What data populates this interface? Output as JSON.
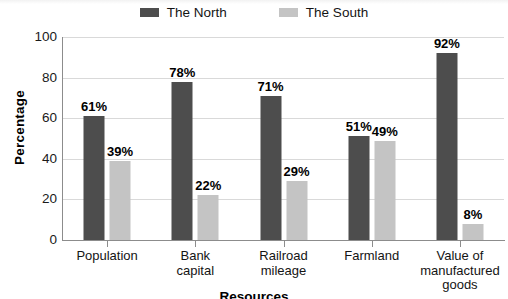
{
  "chart_data": {
    "type": "bar",
    "title": "",
    "xlabel": "Resources",
    "ylabel": "Percentage",
    "ylim": [
      0,
      100
    ],
    "yticks": [
      100,
      80,
      60,
      40,
      20,
      0
    ],
    "grid": true,
    "legend_position": "top-center",
    "categories": [
      "Population",
      "Bank capital",
      "Railroad mileage",
      "Farmland",
      "Value of manufactured goods"
    ],
    "category_lines": [
      [
        "Population"
      ],
      [
        "Bank",
        "capital"
      ],
      [
        "Railroad",
        "mileage"
      ],
      [
        "Farmland"
      ],
      [
        "Value of",
        "manufactured",
        "goods"
      ]
    ],
    "series": [
      {
        "name": "The North",
        "color": "#4d4d4d",
        "values": [
          61,
          78,
          71,
          51,
          92
        ],
        "labels": [
          "61%",
          "78%",
          "71%",
          "51%",
          "92%"
        ]
      },
      {
        "name": "The South",
        "color": "#c4c4c4",
        "values": [
          39,
          22,
          29,
          49,
          8
        ],
        "labels": [
          "39%",
          "22%",
          "29%",
          "49%",
          "8%"
        ]
      }
    ]
  },
  "axis": {
    "y_title": "Percentage",
    "x_title": "Resources",
    "y_tick_labels": [
      "100",
      "80",
      "60",
      "40",
      "20",
      "0"
    ]
  },
  "legend": {
    "entries": [
      {
        "label": "The North",
        "color": "#4d4d4d"
      },
      {
        "label": "The South",
        "color": "#c4c4c4"
      }
    ]
  }
}
